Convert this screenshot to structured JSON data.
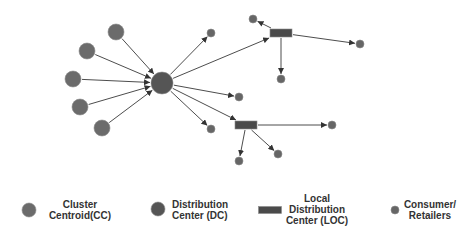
{
  "diagram": {
    "colors": {
      "cluster_centroid": "#6b6b6b",
      "distribution_center": "#555555",
      "local_distribution_center": "#4a4a4a",
      "consumer": "#666666",
      "edge": "#4d4d4d"
    },
    "nodes": [
      {
        "id": "cc1",
        "type": "cluster_centroid",
        "x": 116,
        "y": 32,
        "r": 8
      },
      {
        "id": "cc2",
        "type": "cluster_centroid",
        "x": 87,
        "y": 51,
        "r": 8
      },
      {
        "id": "cc3",
        "type": "cluster_centroid",
        "x": 73,
        "y": 79,
        "r": 8
      },
      {
        "id": "cc4",
        "type": "cluster_centroid",
        "x": 80,
        "y": 107,
        "r": 8
      },
      {
        "id": "cc5",
        "type": "cluster_centroid",
        "x": 102,
        "y": 128,
        "r": 8
      },
      {
        "id": "dc",
        "type": "distribution_center",
        "x": 162,
        "y": 83,
        "r": 11
      },
      {
        "id": "loc1",
        "type": "local_distribution_center",
        "x": 281,
        "y": 33,
        "w": 22,
        "h": 8
      },
      {
        "id": "loc2",
        "type": "local_distribution_center",
        "x": 246,
        "y": 125,
        "w": 22,
        "h": 8
      },
      {
        "id": "c1",
        "type": "consumer",
        "x": 211,
        "y": 33,
        "r": 4
      },
      {
        "id": "c2",
        "type": "consumer",
        "x": 239,
        "y": 97,
        "r": 4
      },
      {
        "id": "c3",
        "type": "consumer",
        "x": 211,
        "y": 129,
        "r": 4
      },
      {
        "id": "c4",
        "type": "consumer",
        "x": 253,
        "y": 19,
        "r": 4
      },
      {
        "id": "c5",
        "type": "consumer",
        "x": 360,
        "y": 44,
        "r": 4
      },
      {
        "id": "c6",
        "type": "consumer",
        "x": 281,
        "y": 79,
        "r": 4
      },
      {
        "id": "c7",
        "type": "consumer",
        "x": 332,
        "y": 125,
        "r": 4
      },
      {
        "id": "c8",
        "type": "consumer",
        "x": 278,
        "y": 154,
        "r": 4
      },
      {
        "id": "c9",
        "type": "consumer",
        "x": 239,
        "y": 161,
        "r": 4
      }
    ],
    "edges": [
      {
        "from": "cc1",
        "to": "dc"
      },
      {
        "from": "cc2",
        "to": "dc"
      },
      {
        "from": "cc3",
        "to": "dc"
      },
      {
        "from": "cc4",
        "to": "dc"
      },
      {
        "from": "cc5",
        "to": "dc"
      },
      {
        "from": "dc",
        "to": "c1"
      },
      {
        "from": "dc",
        "to": "loc1"
      },
      {
        "from": "dc",
        "to": "c2"
      },
      {
        "from": "dc",
        "to": "loc2"
      },
      {
        "from": "dc",
        "to": "c3"
      },
      {
        "from": "loc1",
        "to": "c4"
      },
      {
        "from": "loc1",
        "to": "c5"
      },
      {
        "from": "loc1",
        "to": "c6"
      },
      {
        "from": "loc2",
        "to": "c7"
      },
      {
        "from": "loc2",
        "to": "c8"
      },
      {
        "from": "loc2",
        "to": "c9"
      }
    ]
  },
  "legend": {
    "items": [
      {
        "key": "cluster_centroid",
        "shape": "circle",
        "x": 29,
        "y": 210,
        "r": 7,
        "label_lines": [
          "Cluster",
          "Centroid(CC)"
        ],
        "label_x": 80,
        "label_y": 199
      },
      {
        "key": "distribution_center",
        "shape": "circle",
        "x": 158,
        "y": 209,
        "r": 7,
        "label_lines": [
          "Distribution",
          "Center (DC)"
        ],
        "label_x": 197,
        "label_y": 199
      },
      {
        "key": "local_distribution_center",
        "shape": "rect",
        "x": 270,
        "y": 210,
        "w": 23,
        "h": 7,
        "label_lines": [
          "Local",
          "Distribution",
          "Center (LOC)"
        ],
        "label_x": 317,
        "label_y": 193
      },
      {
        "key": "consumer",
        "shape": "circle",
        "x": 395,
        "y": 210,
        "r": 4,
        "label_lines": [
          "Consumer/",
          "Retailers"
        ],
        "label_x": 430,
        "label_y": 199
      }
    ]
  }
}
